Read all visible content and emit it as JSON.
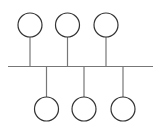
{
  "diagram": {
    "type": "bus-network-topology",
    "colors": {
      "background": "#ffffff",
      "line": "#777777",
      "node_stroke": "#333333"
    },
    "bus": {
      "x1": 8,
      "x2": 153,
      "y": 66.5
    },
    "top_nodes": [
      {
        "cx": 30,
        "cy": 25,
        "r": 12
      },
      {
        "cx": 67.5,
        "cy": 25,
        "r": 12
      },
      {
        "cx": 106,
        "cy": 25,
        "r": 12
      }
    ],
    "bottom_nodes": [
      {
        "cx": 46.5,
        "cy": 109,
        "r": 12
      },
      {
        "cx": 84,
        "cy": 109,
        "r": 12
      },
      {
        "cx": 123,
        "cy": 109,
        "r": 12
      }
    ]
  }
}
